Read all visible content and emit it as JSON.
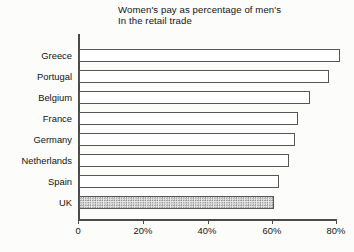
{
  "chart_data": {
    "type": "bar",
    "orientation": "horizontal",
    "title": "Women's pay as percentage of men's",
    "subtitle": "In the retail trade",
    "xlabel": "",
    "ylabel": "",
    "categories": [
      "Greece",
      "Portugal",
      "Belgium",
      "France",
      "Germany",
      "Netherlands",
      "Spain",
      "UK"
    ],
    "values": [
      81,
      77.5,
      71.5,
      68,
      67,
      65,
      62,
      60.5
    ],
    "xlim": [
      0,
      80
    ],
    "xticks": [
      0,
      20,
      40,
      60,
      80
    ],
    "xtick_labels": [
      "0",
      "20%",
      "40%",
      "60%",
      "80%"
    ],
    "grid": false,
    "legend": null,
    "highlight_category": "UK",
    "highlight_style": "stippled-fill",
    "bar_fill": "#ffffff",
    "bar_edge": "#555555",
    "highlight_fill": "#e9e9e9",
    "background": "#fcfcfb"
  }
}
